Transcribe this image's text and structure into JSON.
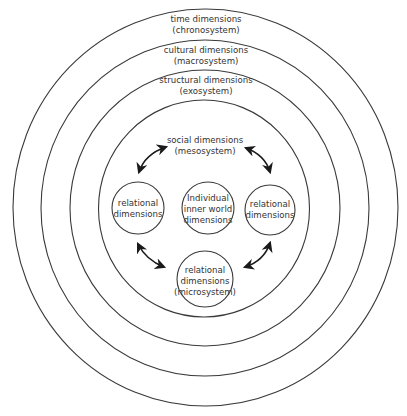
{
  "diagram": {
    "type": "nested-circles",
    "rings": [
      {
        "id": "chronosystem",
        "line1": "time dimensions",
        "line2": "(chronosystem)"
      },
      {
        "id": "macrosystem",
        "line1": "cultural dimensions",
        "line2": "(macrosystem)"
      },
      {
        "id": "exosystem",
        "line1": "structural dimensions",
        "line2": "(exosystem)"
      },
      {
        "id": "mesosystem",
        "line1": "social dimensions",
        "line2": "(mesosystem)"
      }
    ],
    "nodes": {
      "left": {
        "line1": "relational",
        "line2": "dimensions"
      },
      "center": {
        "line1": "Individual",
        "line2": "inner world",
        "line3": "dimensions"
      },
      "right": {
        "line1": "relational",
        "line2": "dimensions"
      },
      "bottom": {
        "line1": "relational",
        "line2": "dimensions",
        "line3": "(microsystem)"
      }
    },
    "arrows": [
      {
        "from": "left",
        "to": "mesosystem-label",
        "type": "double-headed"
      },
      {
        "from": "right",
        "to": "mesosystem-label",
        "type": "double-headed"
      },
      {
        "from": "left",
        "to": "bottom",
        "type": "double-headed"
      },
      {
        "from": "right",
        "to": "bottom",
        "type": "double-headed"
      }
    ],
    "colors": {
      "line": "#3a3a3a",
      "text": "#333333",
      "background": "#ffffff"
    }
  }
}
